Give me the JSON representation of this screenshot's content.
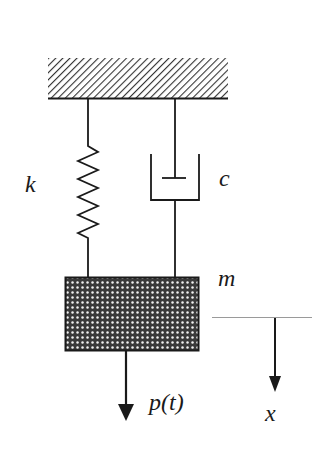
{
  "diagram": {
    "labels": {
      "spring": "k",
      "damper": "c",
      "mass": "m",
      "force": "p(t)",
      "displacement": "x"
    },
    "components": [
      {
        "name": "fixed-support",
        "type": "hatched-ground"
      },
      {
        "name": "spring",
        "label": "k"
      },
      {
        "name": "damper",
        "label": "c"
      },
      {
        "name": "mass",
        "label": "m",
        "fill": "crosshatch"
      },
      {
        "name": "applied-force",
        "label": "p(t)",
        "direction": "down"
      },
      {
        "name": "displacement-reference",
        "label": "x",
        "direction": "down"
      }
    ],
    "colors": {
      "stroke": "#1a1a1a",
      "reference_line": "#9a9a9a",
      "background": "#ffffff"
    }
  }
}
